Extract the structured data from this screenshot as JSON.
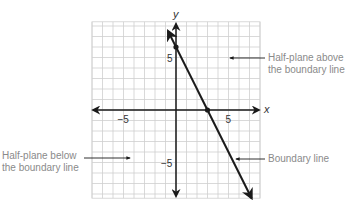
{
  "chart_data": {
    "type": "line",
    "title": "",
    "xlabel": "x",
    "ylabel": "y",
    "xlim": [
      -8,
      8
    ],
    "ylim": [
      -8.4,
      8.4
    ],
    "grid": true,
    "x_ticks_labeled": [
      -5,
      5
    ],
    "y_ticks_labeled": [
      5,
      -5
    ],
    "x_tick_labels": [
      "−5",
      "5"
    ],
    "y_tick_labels": [
      "5",
      "−5"
    ],
    "series": [
      {
        "name": "Boundary line",
        "equation": "y = -2x + 6",
        "slope": -2,
        "intercept": 6,
        "x": [
          -0.75,
          7.2
        ],
        "y": [
          7.5,
          -8.4
        ]
      }
    ],
    "points": [
      {
        "x": 0,
        "y": 6,
        "label": "y-intercept"
      },
      {
        "x": 3,
        "y": 0,
        "label": "x-intercept"
      }
    ],
    "annotations": [
      {
        "text": "Half-plane above the boundary line",
        "lines": [
          "Half-plane above",
          "the boundary line"
        ],
        "arrow_target": "above-right region"
      },
      {
        "text": "Half-plane below the boundary line",
        "lines": [
          "Half-plane below",
          "the boundary line"
        ],
        "arrow_target": "below-left region"
      },
      {
        "text": "Boundary line",
        "lines": [
          "Boundary line"
        ],
        "arrow_target": "line"
      }
    ]
  },
  "labels": {
    "above_1": "Half-plane above",
    "above_2": "the boundary line",
    "below_1": "Half-plane below",
    "below_2": "the boundary line",
    "boundary": "Boundary line",
    "x_axis": "x",
    "y_axis": "y",
    "x_neg5": "−5",
    "x_pos5": "5",
    "y_pos5": "5",
    "y_neg5": "−5"
  },
  "colors": {
    "grid": "#cfcfcf",
    "axis": "#1a1a1a",
    "line": "#1a1a1a",
    "annotation_text": "#8a8a8a"
  }
}
